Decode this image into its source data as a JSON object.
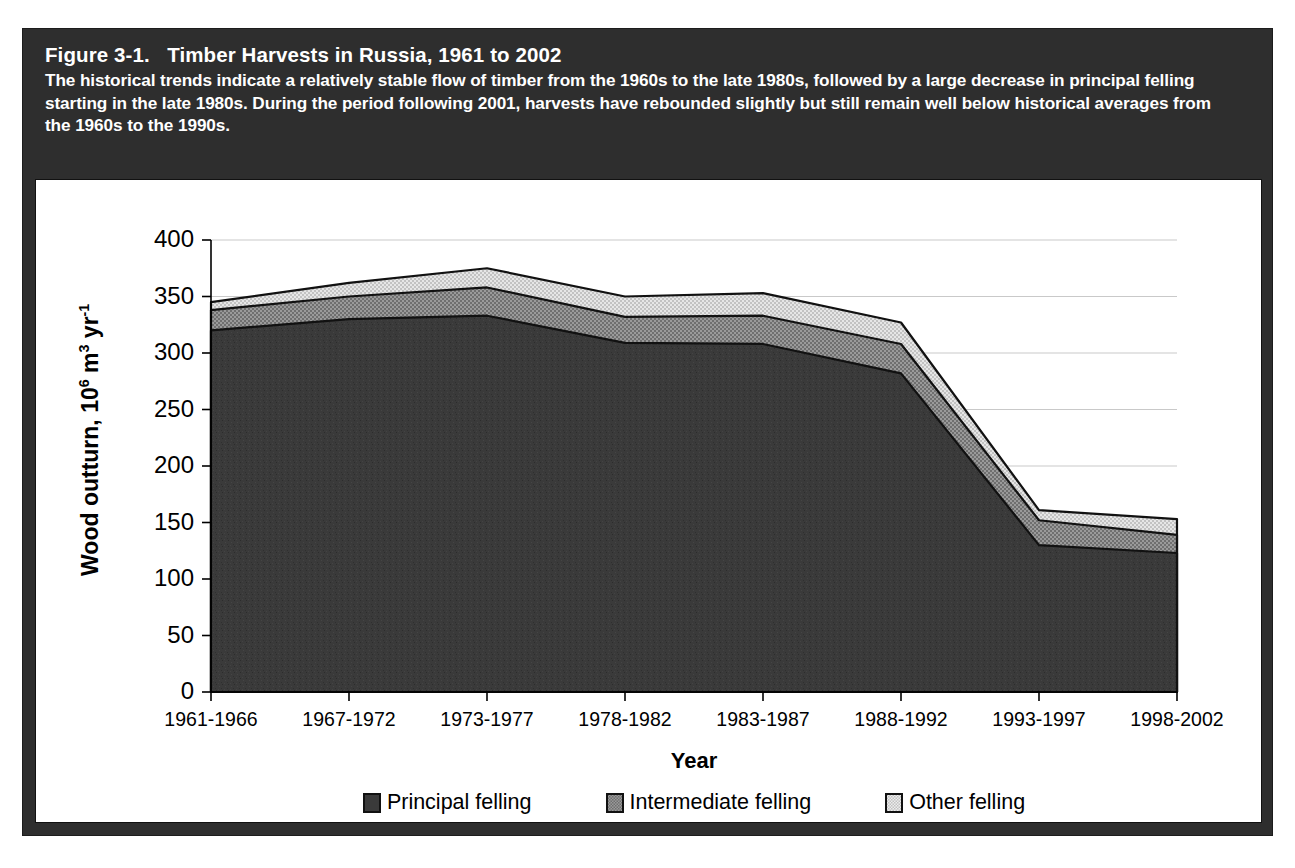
{
  "figure": {
    "caption_title": "Figure 3-1.   Timber Harvests in Russia, 1961 to 2002",
    "caption_body": "The historical trends indicate a relatively stable flow of timber from the 1960s to the late 1980s, followed by a large decrease in principal felling starting in the late 1980s. During the period following 2001, harvests have rebounded slightly but still remain well below historical averages from the 1960s to the 1990s."
  },
  "colors": {
    "caption_background": "#2e2e2e",
    "caption_text": "#ffffff",
    "card_background": "#ffffff",
    "axis": "#000000",
    "gridline": "#c9c9c9",
    "principal_felling": "#3a3a3a",
    "intermediate_felling": "#8c8c8c",
    "other_felling": "#d7d7d7",
    "series_outline": "#111111"
  },
  "chart_data": {
    "type": "area",
    "stacked": true,
    "title": "Timber Harvests in Russia, 1961 to 2002",
    "xlabel": "Year",
    "ylabel": "Wood outturn, 10^6 m^3 yr^-1",
    "ylabel_parts": {
      "prefix": "Wood outturn, 10",
      "sup1": "6",
      "mid": " m",
      "sup2": "3",
      "mid2": " yr",
      "sup3": "-1"
    },
    "categories": [
      "1961-1966",
      "1967-1972",
      "1973-1977",
      "1978-1982",
      "1983-1987",
      "1988-1992",
      "1993-1997",
      "1998-2002"
    ],
    "series": [
      {
        "name": "Principal felling",
        "color": "#3a3a3a",
        "pattern": "solid",
        "values": [
          320,
          330,
          333,
          309,
          308,
          282,
          130,
          123
        ]
      },
      {
        "name": "Intermediate felling",
        "color": "#8c8c8c",
        "pattern": "dense-dotted",
        "values": [
          18,
          20,
          25,
          23,
          25,
          26,
          22,
          16
        ]
      },
      {
        "name": "Other felling",
        "color": "#d7d7d7",
        "pattern": "light-dotted",
        "values": [
          7,
          12,
          17,
          18,
          20,
          19,
          9,
          14
        ]
      }
    ],
    "cumulative_totals": [
      345,
      362,
      375,
      350,
      353,
      327,
      161,
      153
    ],
    "yticks": [
      0,
      50,
      100,
      150,
      200,
      250,
      300,
      350,
      400
    ],
    "ytick_labels": [
      "0",
      "50",
      "100",
      "150",
      "200",
      "250",
      "300",
      "350",
      "400"
    ],
    "ylim": [
      0,
      400
    ],
    "grid": true,
    "grid_axis": "y",
    "legend_position": "bottom"
  }
}
